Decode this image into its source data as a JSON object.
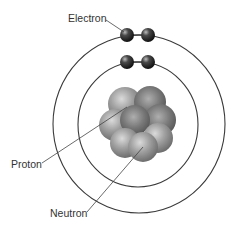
{
  "labels": {
    "electron": "Electron",
    "proton": "Proton",
    "neutron": "Neutron"
  },
  "orbits": [
    {
      "name": "inner-shell",
      "cx": 138,
      "cy": 124,
      "rx": 60,
      "ry": 62,
      "electrons": 2
    },
    {
      "name": "outer-shell",
      "cx": 139,
      "cy": 124,
      "rx": 86,
      "ry": 89,
      "electrons": 2
    }
  ],
  "colors": {
    "orbit": "#333333",
    "electron": "#2a2a2a",
    "nucleus_particle": "#8a8a8a",
    "nucleus_particle_dark": "#555555",
    "leader_line": "#444444",
    "text": "#333333"
  }
}
